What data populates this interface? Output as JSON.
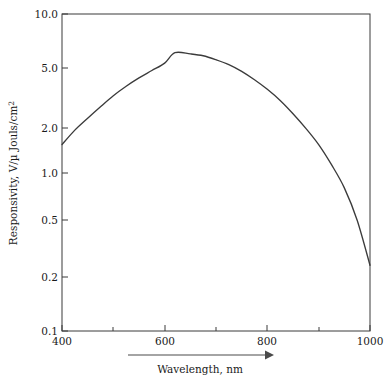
{
  "chart_data": {
    "type": "line",
    "title": "",
    "xlabel": "Wavelength, nm",
    "ylabel": "Responsivity, V/µ Jouls/cm",
    "ylabel_superscript": "2",
    "xscale": "linear",
    "yscale": "log",
    "xlim": [
      400,
      1000
    ],
    "ylim": [
      0.1,
      10.0
    ],
    "grid": false,
    "legend": null,
    "xticks": [
      400,
      500,
      600,
      700,
      800,
      900,
      1000
    ],
    "xtick_labels": [
      "400",
      "",
      "600",
      "",
      "800",
      "",
      "1000"
    ],
    "xticks_labeled": [
      400,
      600,
      800,
      1000
    ],
    "yticks": [
      0.1,
      0.2,
      0.5,
      1.0,
      2.0,
      5.0,
      10.0
    ],
    "ytick_labels": [
      "0.1",
      "0.2",
      "0.5",
      "1.0",
      "2.0",
      "5.0",
      "10.0"
    ],
    "series": [
      {
        "name": "Responsivity",
        "color": "#3b3b3b",
        "x": [
          400,
          425,
          450,
          475,
          500,
          525,
          550,
          575,
          600,
          620,
          650,
          675,
          700,
          725,
          750,
          775,
          800,
          825,
          850,
          875,
          900,
          925,
          950,
          975,
          1000
        ],
        "y": [
          1.5,
          1.85,
          2.2,
          2.6,
          3.05,
          3.5,
          3.95,
          4.4,
          4.9,
          5.7,
          5.6,
          5.45,
          5.15,
          4.8,
          4.35,
          3.85,
          3.35,
          2.85,
          2.35,
          1.9,
          1.5,
          1.12,
          0.8,
          0.5,
          0.26
        ]
      }
    ],
    "annotations": [
      {
        "name": "x-axis-direction-arrow",
        "type": "arrow",
        "label": ""
      }
    ]
  },
  "figure": {
    "background": "#ffffff",
    "axis_color": "#3a3a3a",
    "curve_color": "#3b3b3b",
    "text_color": "#1a1a1a"
  }
}
